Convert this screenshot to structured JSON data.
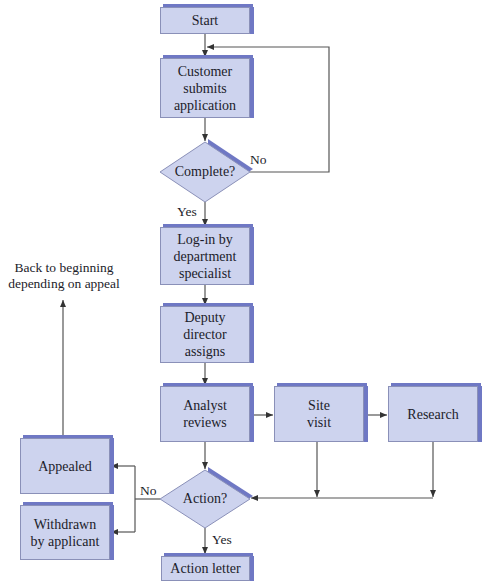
{
  "nodes": {
    "start": {
      "label": "Start"
    },
    "customer": {
      "label": "Customer\nsubmits\napplication"
    },
    "complete": {
      "label": "Complete?"
    },
    "login": {
      "label": "Log-in by\ndepartment\nspecialist"
    },
    "deputy": {
      "label": "Deputy\ndirector\nassigns"
    },
    "analyst": {
      "label": "Analyst\nreviews"
    },
    "site_visit": {
      "label": "Site\nvisit"
    },
    "research": {
      "label": "Research"
    },
    "action": {
      "label": "Action?"
    },
    "appealed": {
      "label": "Appealed"
    },
    "withdrawn": {
      "label": "Withdrawn\nby applicant"
    },
    "action_letter": {
      "label": "Action letter"
    }
  },
  "edge_labels": {
    "complete_no": "No",
    "complete_yes": "Yes",
    "action_no": "No",
    "action_yes": "Yes",
    "back_note": "Back to beginning\ndepending on appeal"
  },
  "colors": {
    "box_fill": "#cdd3ee",
    "box_shadow": "#6f78c4",
    "line": "#444444"
  }
}
